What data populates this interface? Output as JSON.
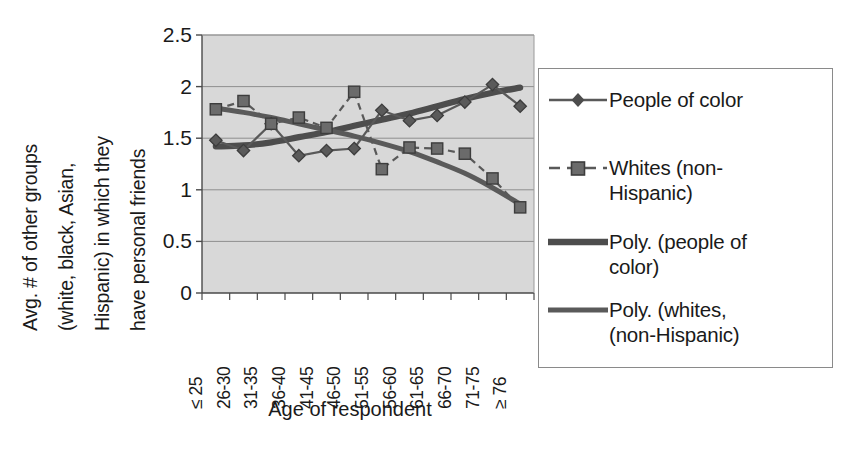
{
  "chart_data": {
    "type": "line",
    "title": "",
    "xlabel": "Age of respondent",
    "ylabel": "Avg. # of other groups (white, black, Asian, Hispanic) in which they have personal friends",
    "ylabel_lines": [
      "Avg. # of other groups",
      "(white, black, Asian,",
      "Hispanic) in which they",
      "have personal friends"
    ],
    "categories": [
      "≤ 25",
      "26-30",
      "31-35",
      "36-40",
      "41-45",
      "46-50",
      "51-55",
      "56-60",
      "61-65",
      "66-70",
      "71-75",
      "≥ 76"
    ],
    "ylim": [
      0,
      2.5
    ],
    "yticks": [
      0,
      0.5,
      1,
      1.5,
      2,
      2.5
    ],
    "ytick_labels": [
      "0",
      "0.5",
      "1",
      "1.5",
      "2",
      "2.5"
    ],
    "grid": true,
    "grid_axis": "y",
    "legend_position": "right",
    "plot_background": "#d8d8d8",
    "series": [
      {
        "name": "People of color",
        "marker": "diamond",
        "line_style": "solid",
        "color": "#595959",
        "values": [
          1.48,
          1.38,
          1.64,
          1.33,
          1.38,
          1.4,
          1.77,
          1.67,
          1.72,
          1.85,
          2.02,
          1.81
        ]
      },
      {
        "name": "Whites (non-Hispanic)",
        "marker": "square",
        "line_style": "dashed",
        "color": "#595959",
        "values": [
          1.78,
          1.86,
          1.64,
          1.7,
          1.6,
          1.95,
          1.2,
          1.41,
          1.4,
          1.35,
          1.11,
          0.83
        ]
      },
      {
        "name": "Poly. (people of color)",
        "marker": "none",
        "line_style": "solid-thick",
        "color": "#4d4d4d",
        "trend": true,
        "values": [
          1.42,
          1.43,
          1.46,
          1.51,
          1.56,
          1.62,
          1.68,
          1.74,
          1.81,
          1.88,
          1.94,
          1.99
        ]
      },
      {
        "name": "Poly. (whites, (non-Hispanic)",
        "marker": "none",
        "line_style": "solid-thick",
        "color": "#5a5a5a",
        "trend": true,
        "values": [
          1.79,
          1.75,
          1.7,
          1.64,
          1.58,
          1.52,
          1.45,
          1.37,
          1.27,
          1.16,
          1.02,
          0.86
        ]
      }
    ]
  },
  "legend": {
    "items": [
      {
        "label": "People of color",
        "key": "line-diamond-solid-key"
      },
      {
        "label": "Whites (non-\nHispanic)",
        "key": "line-square-dashed-key"
      },
      {
        "label": "Poly. (people of\ncolor)",
        "key": "line-thick-solid-key"
      },
      {
        "label": "Poly. (whites,\n(non-Hispanic)",
        "key": "line-thick-solid-key-2"
      }
    ]
  }
}
